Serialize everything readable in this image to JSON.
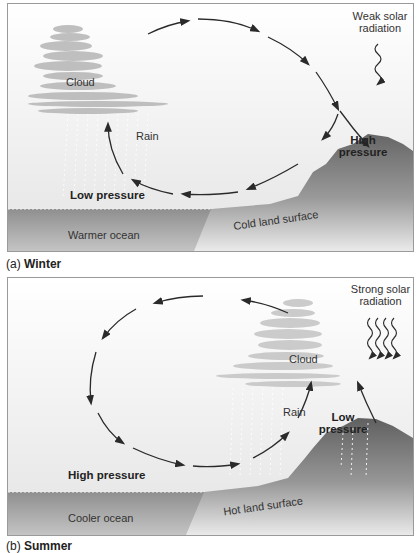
{
  "panels": [
    {
      "id": "a",
      "caption_prefix": "(a)",
      "caption_title": "Winter",
      "labels": {
        "cloud": "Cloud",
        "rain": "Rain",
        "radiation_line1": "Weak solar",
        "radiation_line2": "radiation",
        "pressure_left": "Low pressure",
        "pressure_right_line1": "High",
        "pressure_right_line2": "pressure",
        "ocean": "Warmer ocean",
        "land": "Cold land surface"
      },
      "circulation_direction": "clockwise (rising over ocean, sinking over land)",
      "radiation_arrows": 1
    },
    {
      "id": "b",
      "caption_prefix": "(b)",
      "caption_title": "Summer",
      "labels": {
        "cloud": "Cloud",
        "rain": "Rain",
        "radiation_line1": "Strong solar",
        "radiation_line2": "radiation",
        "pressure_left": "High pressure",
        "pressure_right_line1": "Low",
        "pressure_right_line2": "pressure",
        "ocean": "Cooler ocean",
        "land": "Hot land surface"
      },
      "circulation_direction": "counter-clockwise (rising over land, sinking over ocean)",
      "radiation_arrows": 4
    }
  ],
  "colors": {
    "sky_top": "#ffffff",
    "sky_bottom": "#e6e6e6",
    "ocean": "#9c9c9c",
    "ocean_light": "#bdbdbd",
    "land_dark": "#6e6e6e",
    "land_light": "#d0d0d0",
    "arrow": "#2a2a2a",
    "cloud": "#b8b8b8"
  }
}
